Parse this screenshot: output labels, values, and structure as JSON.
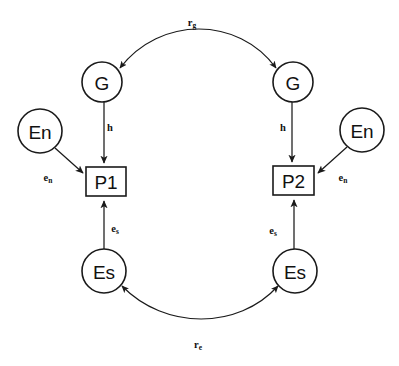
{
  "diagram": {
    "background_color": "#ffffff",
    "stroke_color": "#1a1a1a",
    "nodes": [
      {
        "id": "g-left",
        "label": "G",
        "shape": "circle",
        "cx": 102,
        "cy": 82,
        "r": 20
      },
      {
        "id": "g-right",
        "label": "G",
        "shape": "circle",
        "cx": 293,
        "cy": 82,
        "r": 20
      },
      {
        "id": "en-left",
        "label": "En",
        "shape": "circle",
        "cx": 40,
        "cy": 131,
        "r": 22
      },
      {
        "id": "en-right",
        "label": "En",
        "shape": "circle",
        "cx": 362,
        "cy": 130,
        "r": 22
      },
      {
        "id": "p1",
        "label": "P1",
        "shape": "rect",
        "x": 86,
        "y": 167,
        "w": 40,
        "h": 29
      },
      {
        "id": "p2",
        "label": "P2",
        "shape": "rect",
        "x": 273,
        "y": 166,
        "w": 41,
        "h": 29
      },
      {
        "id": "es-left",
        "label": "Es",
        "shape": "circle",
        "cx": 104,
        "cy": 271,
        "r": 22
      },
      {
        "id": "es-right",
        "label": "Es",
        "shape": "circle",
        "cx": 295,
        "cy": 271,
        "r": 22
      }
    ],
    "edges": [
      {
        "id": "rg",
        "from": "g-left",
        "to": "g-right",
        "kind": "arc",
        "arrowheads": "both",
        "label_base": "r",
        "label_sub": "g",
        "label_x": 192,
        "label_y": 22
      },
      {
        "id": "re",
        "from": "es-left",
        "to": "es-right",
        "kind": "arc",
        "arrowheads": "both",
        "label_base": "r",
        "label_sub": "e",
        "label_x": 198,
        "label_y": 344
      },
      {
        "id": "h-left",
        "from": "g-left",
        "to": "p1",
        "kind": "straight",
        "arrowheads": "end",
        "label_base": "h",
        "label_sub": "",
        "label_x": 106,
        "label_y": 127
      },
      {
        "id": "h-right",
        "from": "g-right",
        "to": "p2",
        "kind": "straight",
        "arrowheads": "end",
        "label_base": "h",
        "label_sub": "",
        "label_x": 286,
        "label_y": 127
      },
      {
        "id": "en-left-e",
        "from": "en-left",
        "to": "p1",
        "kind": "straight",
        "arrowheads": "end",
        "label_base": "e",
        "label_sub": "n",
        "label_x": 48,
        "label_y": 177
      },
      {
        "id": "en-right-e",
        "from": "en-right",
        "to": "p2",
        "kind": "straight",
        "arrowheads": "end",
        "label_base": "e",
        "label_sub": "n",
        "label_x": 340,
        "label_y": 177
      },
      {
        "id": "es-left-e",
        "from": "es-left",
        "to": "p1",
        "kind": "straight",
        "arrowheads": "end",
        "label_base": "e",
        "label_sub": "s",
        "label_x": 113,
        "label_y": 228
      },
      {
        "id": "es-right-e",
        "from": "es-right",
        "to": "p2",
        "kind": "straight",
        "arrowheads": "end",
        "label_base": "e",
        "label_sub": "s",
        "label_x": 274,
        "label_y": 230
      }
    ]
  }
}
